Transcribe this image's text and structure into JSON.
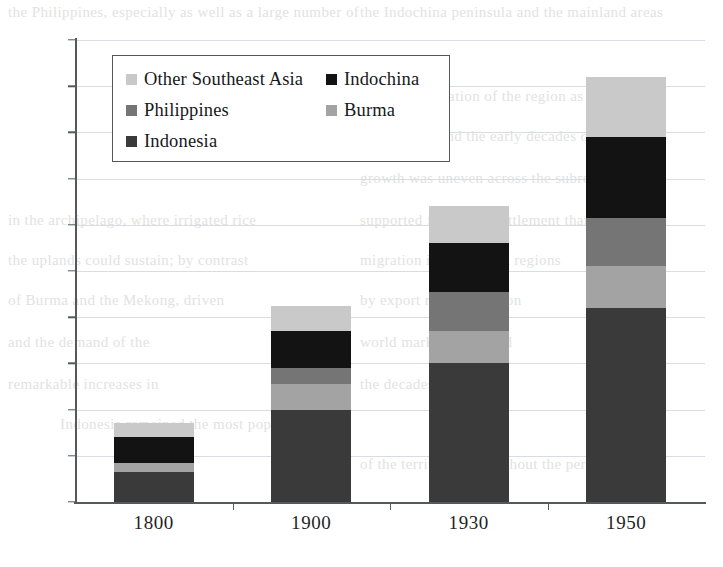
{
  "chart_data": {
    "type": "bar",
    "subtype": "stacked-bar",
    "title": "",
    "subtitle": "",
    "xlabel": "",
    "ylabel": "",
    "categories": [
      "1800",
      "1900",
      "1930",
      "1950"
    ],
    "ylim": [
      0,
      200
    ],
    "yticks": [
      0,
      20,
      40,
      60,
      80,
      100,
      120,
      140,
      160,
      180,
      200
    ],
    "ytick_labels": [
      "0",
      "20",
      "40",
      "60",
      "80",
      "100",
      "120",
      "140",
      "160",
      "180",
      "200"
    ],
    "grid": true,
    "grid_axis": "y",
    "legend_position": "upper-left-inside",
    "stack_order_bottom_to_top": [
      "Indonesia",
      "Burma",
      "Philippines",
      "Indochina",
      "Other Southeast Asia"
    ],
    "series": [
      {
        "name": "Indonesia",
        "color": "#3a3a3a",
        "values": [
          13,
          40,
          60,
          84
        ]
      },
      {
        "name": "Burma",
        "color": "#a3a3a3",
        "values": [
          4,
          11,
          14,
          18
        ]
      },
      {
        "name": "Philippines",
        "color": "#757575",
        "values": [
          0,
          7,
          17,
          21
        ]
      },
      {
        "name": "Indochina",
        "color": "#131313",
        "values": [
          11,
          16,
          21,
          35
        ]
      },
      {
        "name": "Other Southeast Asia",
        "color": "#c9c9c9",
        "values": [
          6,
          11,
          16,
          26
        ]
      }
    ],
    "totals": [
      34,
      85,
      128,
      184
    ]
  },
  "legend": {
    "entries": [
      {
        "label": "Other Southeast Asia",
        "color": "#c9c9c9"
      },
      {
        "label": "Indochina",
        "color": "#131313"
      },
      {
        "label": "Philippines",
        "color": "#757575"
      },
      {
        "label": "Burma",
        "color": "#a3a3a3"
      },
      {
        "label": "Indonesia",
        "color": "#3a3a3a"
      }
    ]
  },
  "axes": {
    "y_labels": [
      "200",
      "180",
      "160",
      "140",
      "120",
      "100",
      "80",
      "60",
      "40",
      "20",
      "0"
    ],
    "x_labels": [
      "1800",
      "1900",
      "1930",
      "1950"
    ]
  },
  "page_bleed": {
    "lines": [
      {
        "text": "the Philippines, especially as well as a large number of",
        "x": 8,
        "y": 4
      },
      {
        "text": "the Indochina peninsula and the mainland areas",
        "x": 360,
        "y": 4
      },
      {
        "text": "that the population of the region as a whole",
        "x": 360,
        "y": 88
      },
      {
        "text": "colonial era and the early decades of the",
        "x": 360,
        "y": 128
      },
      {
        "text": "growth was uneven across the subregions",
        "x": 360,
        "y": 170
      },
      {
        "text": "in the archipelago, where irrigated rice",
        "x": 8,
        "y": 212
      },
      {
        "text": "supported far denser settlement than",
        "x": 360,
        "y": 212
      },
      {
        "text": "the uplands could sustain; by contrast",
        "x": 8,
        "y": 252
      },
      {
        "text": "migration into the delta regions",
        "x": 360,
        "y": 252
      },
      {
        "text": "of Burma and the Mekong, driven",
        "x": 8,
        "y": 292
      },
      {
        "text": "by export rice cultivation",
        "x": 360,
        "y": 292
      },
      {
        "text": "and the demand of the",
        "x": 8,
        "y": 334
      },
      {
        "text": "world market, produced",
        "x": 360,
        "y": 334
      },
      {
        "text": "remarkable increases in",
        "x": 8,
        "y": 376
      },
      {
        "text": "the decades after 1870",
        "x": 360,
        "y": 376
      },
      {
        "text": "Indonesia remained the most populous",
        "x": 60,
        "y": 416
      },
      {
        "text": "of the territories throughout the period",
        "x": 360,
        "y": 456
      }
    ]
  }
}
